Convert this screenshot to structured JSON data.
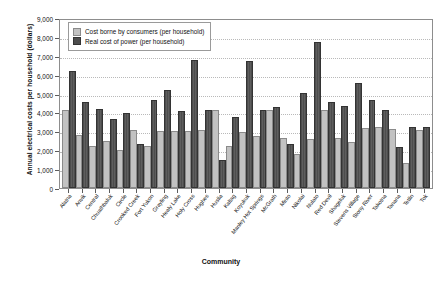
{
  "chart_data": {
    "type": "bar",
    "title": "",
    "xlabel": "Community",
    "ylabel": "Annual electrical costs per household (dollars)",
    "ylim": [
      0,
      9000
    ],
    "ytick_step": 1000,
    "ytick_labels": [
      "9,000",
      "8,000",
      "7,000",
      "6,000",
      "5,000",
      "4,000",
      "3,000",
      "2,000",
      "1,000",
      "0"
    ],
    "grid": true,
    "legend_position": "top-left",
    "categories": [
      "Alatna",
      "Anvik",
      "Central",
      "Chuathbaluk",
      "Circle",
      "Crooked Creek",
      "Fort Yukon",
      "Grayling",
      "Healy Lake",
      "Holy Cross",
      "Hughes",
      "Huslia",
      "Kaltag",
      "Koyukuk",
      "Manley Hot Springs",
      "McGrath",
      "Minto",
      "Nikolai",
      "Nulato",
      "Red Devil",
      "Shageluk",
      "Stevens Village",
      "Stony River",
      "Takotna",
      "Tanana",
      "Tetlin",
      "Tok"
    ],
    "series": [
      {
        "name": "Cost borne by consumers (per household)",
        "color": "#c2c2c2",
        "values": [
          4000,
          2700,
          2100,
          2400,
          1900,
          2950,
          2100,
          2900,
          2900,
          2900,
          2950,
          4050,
          2100,
          2850,
          2650,
          4050,
          2550,
          1700,
          2500,
          4050,
          2550,
          2350,
          3050,
          3100,
          3000,
          1200,
          2950
        ]
      },
      {
        "name": "Real cost of power (per household)",
        "color": "#4d4d4d",
        "values": [
          6100,
          4450,
          4100,
          3550,
          3850,
          2250,
          4550,
          5100,
          3950,
          6650,
          4000,
          1400,
          3650,
          6600,
          4000,
          4200,
          2200,
          4900,
          7650,
          4450,
          4250,
          5450,
          4550,
          4050,
          2050,
          3150,
          3150
        ]
      }
    ]
  },
  "legend": {
    "items": [
      {
        "label": "Cost borne by consumers (per household)"
      },
      {
        "label": "Real cost of power (per household)"
      }
    ]
  }
}
